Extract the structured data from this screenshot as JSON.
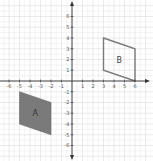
{
  "diagram": {
    "type": "coordinate-grid",
    "x_range": [
      -6,
      6
    ],
    "y_range": [
      -6,
      6
    ],
    "x_ticks": [
      "-6",
      "-5",
      "-4",
      "-3",
      "-2",
      "-1",
      "1",
      "2",
      "3",
      "4",
      "5",
      "6"
    ],
    "y_ticks": [
      "6",
      "5",
      "4",
      "3",
      "2",
      "1",
      "-1",
      "-2",
      "-3",
      "-4",
      "-5",
      "-6"
    ],
    "colors": {
      "grid": "#e4e4e4",
      "axis": "#333333",
      "shape_a_fill": "#7a7a7a",
      "shape_b_stroke": "#7a7a7a"
    },
    "shapes": [
      {
        "label": "A",
        "style": "filled",
        "vertices": [
          [
            -5,
            -1
          ],
          [
            -2,
            -2
          ],
          [
            -2,
            -5
          ],
          [
            -5,
            -4
          ]
        ]
      },
      {
        "label": "B",
        "style": "outline",
        "vertices": [
          [
            3,
            4
          ],
          [
            6,
            3
          ],
          [
            6,
            0
          ],
          [
            3,
            1
          ]
        ]
      }
    ]
  }
}
